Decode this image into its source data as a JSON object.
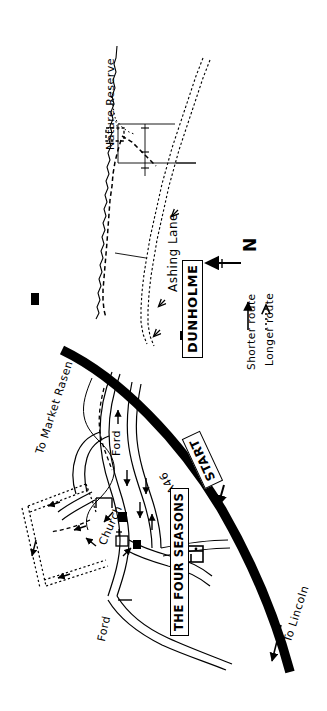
{
  "map": {
    "title": "Dunholme walking route map",
    "place_labels": {
      "nature_reserve": "Nature Reserve",
      "ashing_lane": "Ashing Lane",
      "dunholme": "DUNHOLME",
      "start": "START",
      "the_four_seasons": "THE FOUR SEASONS",
      "church": "Church",
      "ford_upper": "Ford",
      "ford_lower": "Ford",
      "to_market_rasen": "To Market Rasen",
      "to_lincoln": "To Lincoln",
      "road_a46": "A46"
    },
    "compass": {
      "label": "N",
      "name": "north-arrow"
    },
    "legend": {
      "items": [
        {
          "symbol": "solid-arrow",
          "label": "Shorter route"
        },
        {
          "symbol": "dotted-arrow",
          "label": "Longer route"
        }
      ]
    },
    "icons": {
      "pub": "pub-building-icon",
      "church": "church-icon",
      "building_north": "building-icon",
      "building_village_a": "building-icon",
      "building_village_b": "building-icon"
    },
    "colors": {
      "ink": "#000000",
      "paper": "#ffffff"
    }
  }
}
